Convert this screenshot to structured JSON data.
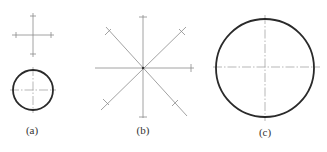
{
  "figure": {
    "panels": [
      {
        "id": "a",
        "label": "(a)",
        "description": "Center cross with tick marks above a small circle with center lines"
      },
      {
        "id": "b",
        "label": "(b)",
        "description": "Eight radial lines (horizontal, vertical, two diagonals) with tick marks at ends"
      },
      {
        "id": "c",
        "label": "(c)",
        "description": "Large circle with dash-dot center lines"
      }
    ]
  },
  "colors": {
    "line": "#2a2a2a",
    "construction": "#8a8a8a",
    "background": "#ffffff"
  }
}
